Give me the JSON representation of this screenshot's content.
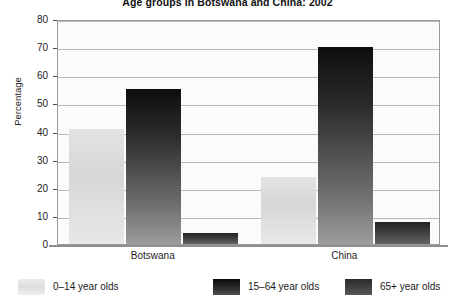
{
  "chart_data": {
    "type": "bar",
    "title": "Age groups in Botswana and China: 2002",
    "xlabel": "",
    "ylabel": "Percentage",
    "ylim": [
      0,
      80
    ],
    "y_ticks": [
      0,
      10,
      20,
      30,
      40,
      50,
      60,
      70,
      80
    ],
    "grid": true,
    "legend_position": "bottom",
    "categories": [
      "Botswana",
      "China"
    ],
    "series": [
      {
        "name": "0–14 year olds",
        "values": [
          41,
          24
        ],
        "color": "#dcdcdc"
      },
      {
        "name": "15–64 year olds",
        "values": [
          55,
          70
        ],
        "color": "#1a1a1a"
      },
      {
        "name": "65+ year olds",
        "values": [
          4,
          8
        ],
        "color": "#3b3b3b"
      }
    ]
  },
  "axis": {
    "y_title": "Percentage",
    "y_tick_labels": [
      "80",
      "70",
      "60",
      "50",
      "40",
      "30",
      "20",
      "10",
      "0"
    ]
  },
  "legend": {
    "items": [
      {
        "label": "0–14 year olds"
      },
      {
        "label": "15–64 year olds"
      },
      {
        "label": "65+ year olds"
      }
    ]
  }
}
